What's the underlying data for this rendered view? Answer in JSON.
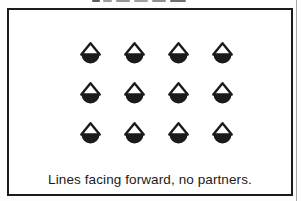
{
  "caption": "Lines facing forward, no partners.",
  "formation": {
    "name": "lines-facing-forward-no-partners",
    "rows": 3,
    "cols": 4,
    "dancer_count": 12,
    "dancer_symbol": "dancer-facing-up-icon"
  },
  "colors": {
    "ink": "#1b1b1b",
    "paper": "#ffffff",
    "scan_line": "#a8a8a8"
  }
}
